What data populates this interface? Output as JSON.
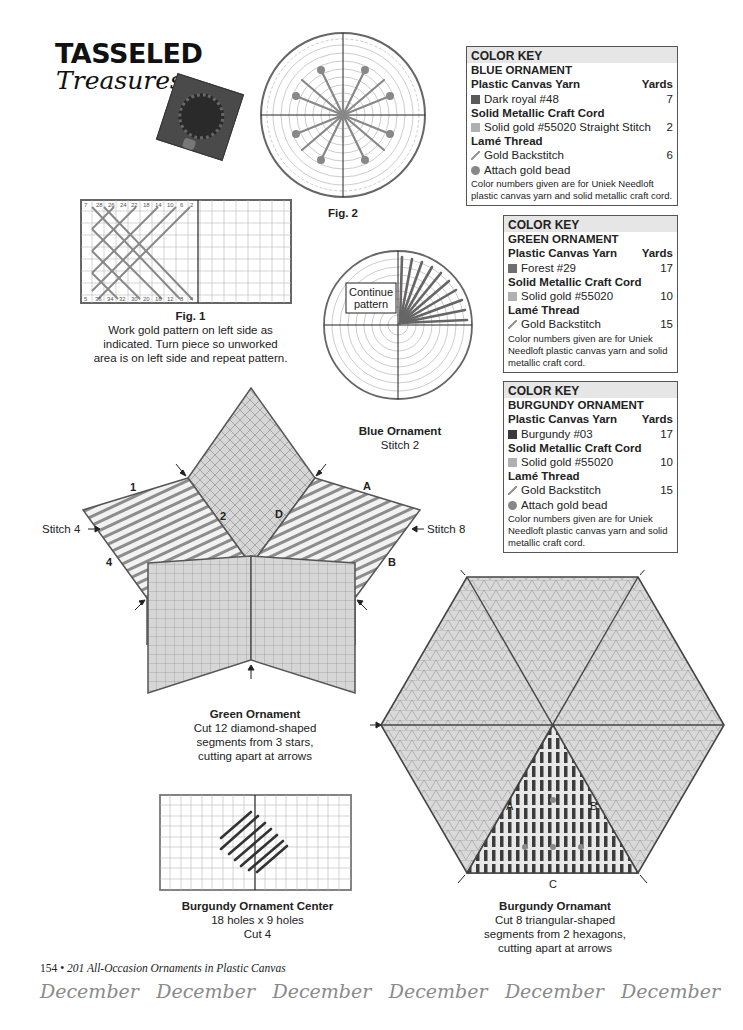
{
  "header": {
    "title_main": "TASSELED",
    "title_sub": "Treasures"
  },
  "color_keys": {
    "blue": {
      "heading": "COLOR KEY",
      "ornament": "BLUE ORNAMENT",
      "sections": [
        {
          "label": "Plastic Canvas Yarn",
          "right": "Yards"
        },
        {
          "label": "Solid Metallic Craft Cord"
        },
        {
          "label": "Lamé Thread"
        }
      ],
      "items": [
        {
          "name": "Dark royal #48",
          "yards": "7",
          "swatch": "dark-royal"
        },
        {
          "name": "Solid gold #55020 Straight Stitch",
          "yards": "2",
          "swatch": "gold"
        },
        {
          "name": "Gold Backstitch",
          "yards": "6",
          "swatch": "backstitch"
        },
        {
          "name": "Attach gold bead",
          "swatch": "bead"
        }
      ],
      "note": "Color numbers given are for Uniek Needloft plastic canvas yarn and solid metallic craft cord."
    },
    "green": {
      "heading": "COLOR KEY",
      "ornament": "GREEN ORNAMENT",
      "sections": [
        {
          "label": "Plastic Canvas Yarn",
          "right": "Yards"
        },
        {
          "label": "Solid Metallic Craft Cord"
        },
        {
          "label": "Lamé Thread"
        }
      ],
      "items": [
        {
          "name": "Forest #29",
          "yards": "17",
          "swatch": "forest"
        },
        {
          "name": "Solid gold #55020",
          "yards": "10",
          "swatch": "gold"
        },
        {
          "name": "Gold Backstitch",
          "yards": "15",
          "swatch": "backstitch"
        }
      ],
      "note": "Color numbers given are for Uniek Needloft plastic canvas yarn and solid metallic craft cord."
    },
    "burgundy": {
      "heading": "COLOR KEY",
      "ornament": "BURGUNDY ORNAMENT",
      "sections": [
        {
          "label": "Plastic Canvas Yarn",
          "right": "Yards"
        },
        {
          "label": "Solid Metallic Craft Cord"
        },
        {
          "label": "Lamé Thread"
        }
      ],
      "items": [
        {
          "name": "Burgundy #03",
          "yards": "17",
          "swatch": "burgundy"
        },
        {
          "name": "Solid gold #55020",
          "yards": "10",
          "swatch": "gold"
        },
        {
          "name": "Gold Backstitch",
          "yards": "15",
          "swatch": "backstitch"
        },
        {
          "name": "Attach gold bead",
          "swatch": "bead"
        }
      ],
      "note": "Color numbers given are for Uniek Needloft plastic canvas yarn and solid metallic craft cord."
    }
  },
  "figures": {
    "fig1": {
      "label": "Fig. 1",
      "caption_lines": [
        "Work gold pattern on left side as",
        "indicated. Turn piece so unworked",
        "area is on left side and repeat pattern."
      ],
      "top_numbers": [
        "7",
        "28",
        "26",
        "24",
        "22",
        "18",
        "14",
        "10",
        "6",
        "2"
      ],
      "bottom_numbers": [
        "5",
        "36",
        "34",
        "32",
        "30",
        "20",
        "16",
        "12",
        "8",
        "4"
      ]
    },
    "fig2": {
      "label": "Fig. 2"
    },
    "blue_ornament": {
      "title": "Blue Ornament",
      "subtitle": "Stitch 2",
      "callout": [
        "Continue",
        "pattern"
      ]
    },
    "green_ornament": {
      "title": "Green Ornament",
      "caption_lines": [
        "Cut 12 diamond-shaped",
        "segments from 3 stars,",
        "cutting apart at arrows"
      ],
      "labels": {
        "n1": "1",
        "n2": "2",
        "n3": "3",
        "n4": "4",
        "a": "A",
        "b": "B",
        "c": "C",
        "d": "D"
      },
      "stitch_left": "Stitch 4",
      "stitch_right": "Stitch 8"
    },
    "burgundy_center": {
      "title": "Burgundy Ornament Center",
      "caption_lines": [
        "18 holes x 9 holes",
        "Cut 4"
      ]
    },
    "burgundy_ornament": {
      "title": "Burgundy Ornamant",
      "caption_lines": [
        "Cut 8 triangular-shaped",
        "segments from 2 hexagons,",
        "cutting apart at arrows"
      ],
      "labels": {
        "a": "A",
        "b": "B",
        "c": "C"
      }
    }
  },
  "footer": {
    "page_number": "154",
    "bullet": "•",
    "book_title": "201 All-Occasion Ornaments in Plastic Canvas",
    "month_repeat": [
      "December",
      "December",
      "December",
      "December",
      "December",
      "December"
    ]
  }
}
